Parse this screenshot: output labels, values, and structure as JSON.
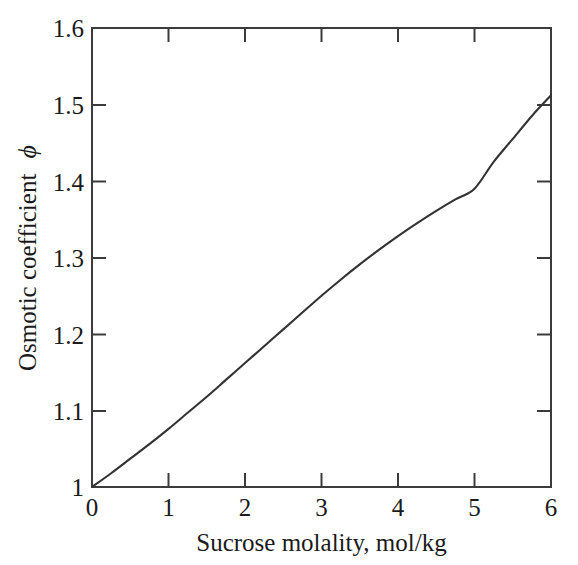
{
  "chart_data": {
    "type": "line",
    "title": "",
    "subtitle": "",
    "xlabel": "Sucrose molality, mol/kg",
    "ylabel": "Osmotic coefficient ϕ",
    "ylabel_text": "Osmotic coefficient",
    "ylabel_symbol": "ϕ",
    "xlim": [
      0,
      6
    ],
    "ylim": [
      1.0,
      1.6
    ],
    "grid": false,
    "legend": null,
    "legend_position": "none",
    "xticks": [
      0,
      1,
      2,
      3,
      4,
      5,
      6
    ],
    "xtick_labels": [
      "0",
      "1",
      "2",
      "3",
      "4",
      "5",
      "6"
    ],
    "yticks": [
      1.0,
      1.1,
      1.2,
      1.3,
      1.4,
      1.5,
      1.6
    ],
    "ytick_labels": [
      "1",
      "1.1",
      "1.2",
      "1.3",
      "1.4",
      "1.5",
      "1.6"
    ],
    "line_color": "#333333",
    "frame_color": "#3b3b3b",
    "background_color": "#ffffff",
    "x": [
      0,
      0.25,
      0.5,
      0.75,
      1.0,
      1.25,
      1.5,
      1.75,
      2.0,
      2.25,
      2.5,
      2.75,
      3.0,
      3.25,
      3.5,
      3.75,
      4.0,
      4.25,
      4.5,
      4.75,
      5.0,
      5.25,
      5.5,
      5.75,
      6.0
    ],
    "y": [
      1.0,
      1.018,
      1.037,
      1.056,
      1.076,
      1.097,
      1.118,
      1.14,
      1.162,
      1.184,
      1.206,
      1.228,
      1.25,
      1.271,
      1.291,
      1.31,
      1.328,
      1.345,
      1.361,
      1.376,
      1.39,
      1.425,
      1.455,
      1.485,
      1.512
    ],
    "series": [
      {
        "name": "Osmotic coefficient of sucrose",
        "x": [
          0,
          0.25,
          0.5,
          0.75,
          1.0,
          1.25,
          1.5,
          1.75,
          2.0,
          2.25,
          2.5,
          2.75,
          3.0,
          3.25,
          3.5,
          3.75,
          4.0,
          4.25,
          4.5,
          4.75,
          5.0,
          5.25,
          5.5,
          5.75,
          6.0
        ],
        "y": [
          1.0,
          1.018,
          1.037,
          1.056,
          1.076,
          1.097,
          1.118,
          1.14,
          1.162,
          1.184,
          1.206,
          1.228,
          1.25,
          1.271,
          1.291,
          1.31,
          1.328,
          1.345,
          1.361,
          1.376,
          1.39,
          1.425,
          1.455,
          1.485,
          1.512
        ]
      }
    ],
    "key_points": [
      {
        "x": 0,
        "y": 1.0
      },
      {
        "x": 1,
        "y": 1.076
      },
      {
        "x": 2,
        "y": 1.162
      },
      {
        "x": 3,
        "y": 1.25
      },
      {
        "x": 4,
        "y": 1.328
      },
      {
        "x": 5,
        "y": 1.39
      },
      {
        "x": 6,
        "y": 1.512
      }
    ]
  }
}
